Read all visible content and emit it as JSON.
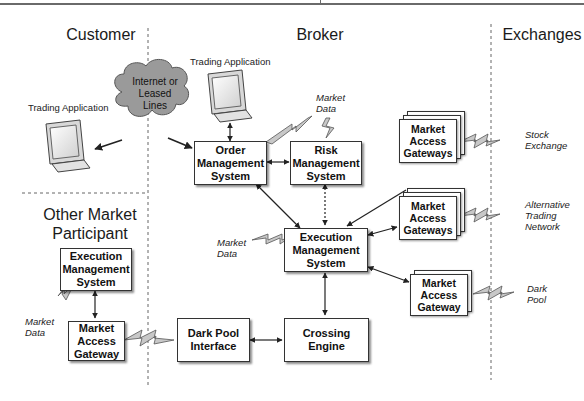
{
  "sections": {
    "customer": "Customer",
    "broker": "Broker",
    "exchanges": "Exchanges",
    "other_participant": "Other Market\nParticipant"
  },
  "terminals": {
    "customer_trading_app": "Trading Application",
    "broker_trading_app": "Trading Application"
  },
  "cloud": {
    "label": "Internet or\nLeased\nLines"
  },
  "boxes": {
    "order_management": "Order\nManagement\nSystem",
    "risk_management": "Risk\nManagement\nSystem",
    "execution_management": "Execution\nManagement\nSystem",
    "crossing_engine": "Crossing\nEngine",
    "dark_pool_interface": "Dark Pool\nInterface",
    "other_ems": "Execution\nManagement\nSystem",
    "other_gateway": "Market\nAccess\nGateway"
  },
  "gateways": {
    "stock": "Market\nAccess\nGateways",
    "alternative": "Market\nAccess\nGateways",
    "dark": "Market\nAccess\nGateway"
  },
  "market_data_labels": {
    "broker_top": "Market\nData",
    "broker_ems": "Market\nData",
    "other_participant": "Market\nData"
  },
  "exchange_labels": {
    "stock": "Stock\nExchange",
    "alternative": "Alternative\nTrading\nNetwork",
    "dark": "Dark\nPool"
  },
  "colors": {
    "line": "#222222",
    "bolt_fill": "#c8c8c8",
    "cloud_fill": "#9a9a9a",
    "divider": "#666666"
  }
}
